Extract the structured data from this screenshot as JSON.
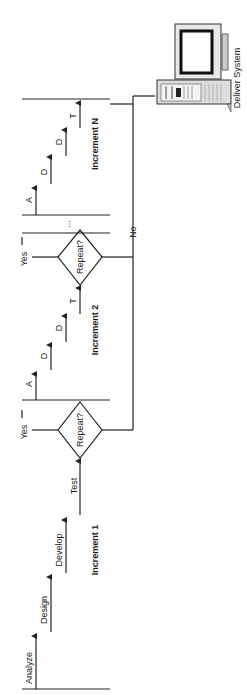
{
  "diagram": {
    "increment_1": {
      "label": "Increment 1",
      "steps": [
        "Analyze",
        "Design",
        "Develop",
        "Test"
      ]
    },
    "decision_1": {
      "label": "Repeat?",
      "yes": "Yes"
    },
    "increment_2": {
      "label": "Increment 2",
      "steps": [
        "A",
        "D",
        "D",
        "T"
      ]
    },
    "decision_2": {
      "label": "Repeat?",
      "yes": "Yes",
      "no": "No"
    },
    "ellipsis": "...",
    "increment_n": {
      "label": "Increment N",
      "steps": [
        "A",
        "D",
        "D",
        "T"
      ]
    },
    "deliver": {
      "label": "Deliver System",
      "icon": "computer-icon"
    },
    "colors": {
      "line": "#222222",
      "background": "#ffffff"
    }
  }
}
